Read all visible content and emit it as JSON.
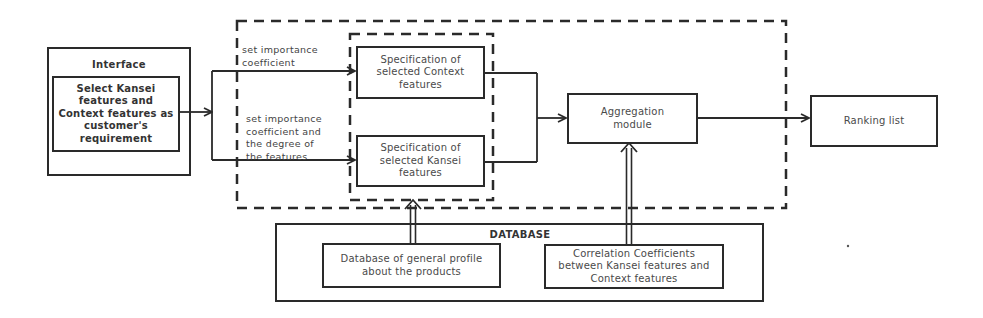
{
  "diagram": {
    "interface_group": {
      "title": "Interface",
      "node": "Select Kansei features and Context features as customer's requirement"
    },
    "edges": {
      "upper_label": "set importance\ncoefficient",
      "lower_label": "set importance\ncoefficient and\nthe degree of\nthe features"
    },
    "specification_nodes": {
      "context": "Specification of selected Context features",
      "kansei": "Specification of selected Kansei features"
    },
    "aggregation": "Aggregation module",
    "ranking": "Ranking list",
    "database_group": {
      "title": "DATABASE",
      "general_profile": "Database of general profile about the products",
      "correlation": "Correlation Coefficients between Kansei features and Context features"
    },
    "colors": {
      "line": "#2a2a2a",
      "text": "#4a4a4a",
      "background": "#ffffff"
    }
  }
}
